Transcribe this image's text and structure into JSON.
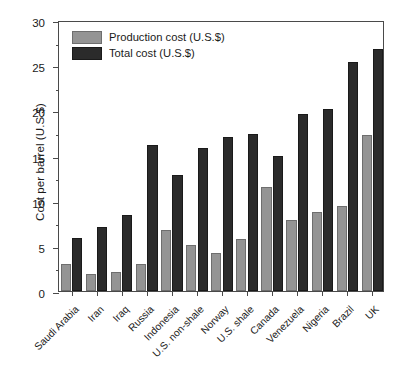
{
  "chart_data": {
    "type": "bar",
    "title": "",
    "xlabel": "",
    "ylabel": "Cost per barrel (U.S.$)",
    "ylim": [
      0,
      30
    ],
    "ytick_step": 5,
    "yticks": [
      0,
      5,
      10,
      15,
      20,
      25,
      30
    ],
    "ytick_labels": [
      "0",
      "5",
      "10",
      "15",
      "20",
      "25",
      "30"
    ],
    "yminor_step": 2.5,
    "grid": false,
    "legend_position": "upper left",
    "categories": [
      "Saudi Arabia",
      "Iran",
      "Iraq",
      "Russia",
      "Indonesia",
      "U.S. non-shale",
      "Norway",
      "U.S. shale",
      "Canada",
      "Venezuela",
      "Nigeria",
      "Brazil",
      "UK"
    ],
    "series": [
      {
        "name": "Production cost (U.S.$)",
        "color": "#949494",
        "values": [
          3.0,
          1.9,
          2.1,
          3.0,
          6.8,
          5.1,
          4.2,
          5.8,
          11.5,
          7.9,
          8.7,
          9.4,
          17.3
        ]
      },
      {
        "name": "Total cost (U.S.$)",
        "color": "#2b2b2b",
        "values": [
          5.9,
          7.1,
          8.4,
          16.2,
          12.8,
          15.8,
          17.0,
          17.4,
          15.0,
          19.6,
          20.1,
          25.4,
          26.8
        ]
      }
    ]
  },
  "legend": {
    "items": [
      {
        "label": "Production cost (U.S.$)",
        "swatch": "production"
      },
      {
        "label": "Total cost (U.S.$)",
        "swatch": "total"
      }
    ]
  }
}
